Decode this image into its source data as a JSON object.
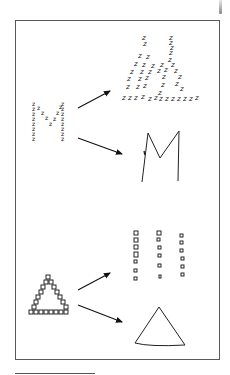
{
  "figure": {
    "type": "hierarchical-letter-stimuli-illustration",
    "panels": [
      {
        "stimulus": {
          "global_shape": "M",
          "local_element": "z"
        },
        "outputs": [
          {
            "label": "local-only reproduction",
            "description": "scattered z elements, global M shape lost"
          },
          {
            "label": "global-only reproduction",
            "description": "simple hand-drawn M outline"
          }
        ]
      },
      {
        "stimulus": {
          "global_shape": "triangle",
          "local_element": "small squares"
        },
        "outputs": [
          {
            "label": "local-only reproduction",
            "description": "three columns of small squares"
          },
          {
            "label": "global-only reproduction",
            "description": "simple hand-drawn triangle outline"
          }
        ]
      }
    ],
    "local_glyph": "z",
    "colors": {
      "ink": "#111111",
      "frame": "#5a5a5a",
      "background": "#ffffff"
    }
  }
}
